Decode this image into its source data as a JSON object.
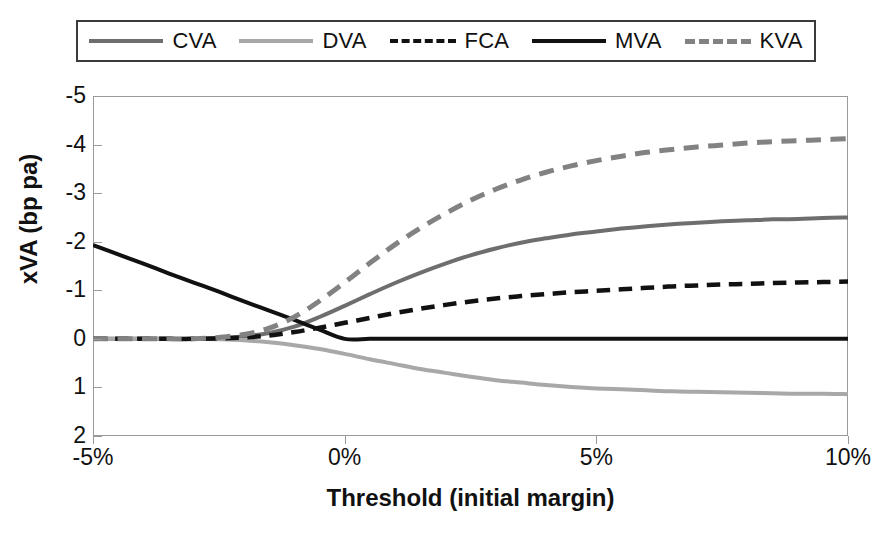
{
  "chart_data": {
    "type": "line",
    "title": "",
    "xlabel": "Threshold (initial margin)",
    "ylabel": "xVA (bp pa)",
    "xlim": [
      -5,
      10
    ],
    "ylim": [
      -5,
      2
    ],
    "y_inverted": true,
    "grid": false,
    "legend_position": "top",
    "xunit": "%",
    "xticks": [
      -5,
      0,
      5,
      10
    ],
    "xticklabels": [
      "-5%",
      "0%",
      "5%",
      "10%"
    ],
    "yticks": [
      -5,
      -4,
      -3,
      -2,
      -1,
      0,
      1,
      2
    ],
    "yticklabels": [
      "-5",
      "-4",
      "-3",
      "-2",
      "-1",
      "0",
      "1",
      "2"
    ],
    "x": [
      -5,
      -4.5,
      -4,
      -3.5,
      -3,
      -2.5,
      -2,
      -1.5,
      -1,
      -0.5,
      0,
      0.5,
      1,
      1.5,
      2,
      2.5,
      3,
      3.5,
      4,
      4.5,
      5,
      5.5,
      6,
      6.5,
      7,
      7.5,
      8,
      8.5,
      9,
      9.5,
      10
    ],
    "series": [
      {
        "name": "CVA",
        "color": "#6e6e6e",
        "style": "solid",
        "width": 4,
        "values": [
          0,
          0,
          0,
          0,
          0,
          -0.02,
          -0.05,
          -0.12,
          -0.25,
          -0.45,
          -0.68,
          -0.92,
          -1.15,
          -1.36,
          -1.55,
          -1.72,
          -1.86,
          -1.98,
          -2.07,
          -2.15,
          -2.21,
          -2.27,
          -2.32,
          -2.36,
          -2.39,
          -2.42,
          -2.44,
          -2.46,
          -2.47,
          -2.49,
          -2.5
        ]
      },
      {
        "name": "DVA",
        "color": "#a8a8a8",
        "style": "solid",
        "width": 4,
        "values": [
          0,
          0,
          0,
          0,
          0,
          0.01,
          0.03,
          0.07,
          0.13,
          0.21,
          0.31,
          0.42,
          0.52,
          0.62,
          0.7,
          0.78,
          0.85,
          0.9,
          0.95,
          0.99,
          1.02,
          1.04,
          1.06,
          1.08,
          1.09,
          1.1,
          1.11,
          1.12,
          1.13,
          1.13,
          1.14
        ]
      },
      {
        "name": "FCA",
        "color": "#111111",
        "style": "dashed",
        "width": 4.5,
        "values": [
          0,
          0,
          0,
          0,
          0,
          -0.01,
          -0.03,
          -0.07,
          -0.14,
          -0.23,
          -0.33,
          -0.43,
          -0.53,
          -0.62,
          -0.7,
          -0.77,
          -0.83,
          -0.88,
          -0.92,
          -0.96,
          -0.99,
          -1.02,
          -1.05,
          -1.08,
          -1.1,
          -1.12,
          -1.13,
          -1.15,
          -1.16,
          -1.17,
          -1.18
        ]
      },
      {
        "name": "MVA",
        "color": "#111111",
        "style": "solid",
        "width": 4,
        "values": [
          -1.93,
          -1.74,
          -1.55,
          -1.35,
          -1.16,
          -0.97,
          -0.77,
          -0.58,
          -0.39,
          -0.19,
          0,
          0,
          0,
          0,
          0,
          0,
          0,
          0,
          0,
          0,
          0,
          0,
          0,
          0,
          0,
          0,
          0,
          0,
          0,
          0,
          0
        ]
      },
      {
        "name": "KVA",
        "color": "#828282",
        "style": "dashed",
        "width": 5,
        "values": [
          0,
          0,
          0,
          0,
          0,
          -0.03,
          -0.09,
          -0.22,
          -0.45,
          -0.78,
          -1.16,
          -1.56,
          -1.94,
          -2.28,
          -2.58,
          -2.85,
          -3.08,
          -3.27,
          -3.43,
          -3.56,
          -3.67,
          -3.76,
          -3.84,
          -3.9,
          -3.95,
          -3.99,
          -4.03,
          -4.06,
          -4.08,
          -4.1,
          -4.12
        ]
      }
    ]
  },
  "legend": {
    "entries": [
      {
        "label": "CVA"
      },
      {
        "label": "DVA"
      },
      {
        "label": "FCA"
      },
      {
        "label": "MVA"
      },
      {
        "label": "KVA"
      }
    ]
  }
}
